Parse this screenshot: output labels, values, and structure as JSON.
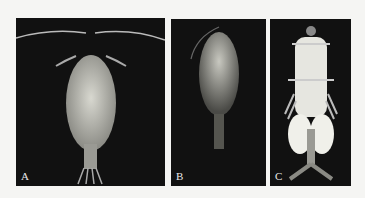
{
  "figure": {
    "panels": [
      {
        "id": "A",
        "label": "A",
        "subject": "copepod specimen, dorsal view, long antennae"
      },
      {
        "id": "B",
        "label": "B",
        "subject": "copepod specimen, dorsal view, translucent"
      },
      {
        "id": "C",
        "label": "C",
        "subject": "copepod specimen, dorsal view, with egg sacs"
      }
    ],
    "colors": {
      "panel_background": "#111111",
      "page_background": "#f5f5f3",
      "label_color": "#e8e8e8"
    }
  }
}
